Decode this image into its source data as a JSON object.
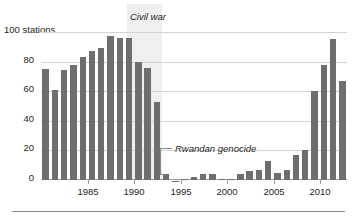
{
  "chart_data": {
    "type": "bar",
    "title": "",
    "subtitle": "",
    "xlabel": "",
    "ylabel": "100 stations",
    "ylim": [
      0,
      100
    ],
    "xlim": [
      1981,
      2013
    ],
    "grid": true,
    "legend_position": "none",
    "yticks": [
      0,
      20,
      40,
      60,
      80,
      100
    ],
    "ytick_labels": [
      "0",
      "20",
      "40",
      "60",
      "80",
      "100 stations"
    ],
    "xticks": [
      1985,
      1990,
      1995,
      2000,
      2005,
      2010
    ],
    "xtick_labels": [
      "1985",
      "1990",
      "1995",
      "2000",
      "2005",
      "2010"
    ],
    "bar_color": "#6e6e6e",
    "shade_color": "#efefef",
    "gridline_color": "#d3d3d3",
    "categories": [
      1981,
      1982,
      1983,
      1984,
      1985,
      1986,
      1987,
      1988,
      1989,
      1990,
      1991,
      1992,
      1993,
      1994,
      1995,
      1996,
      1997,
      1998,
      1999,
      2000,
      2001,
      2002,
      2003,
      2004,
      2005,
      2006,
      2007,
      2008,
      2009,
      2010,
      2011,
      2012,
      2013
    ],
    "values": [
      75,
      61,
      74,
      78,
      83,
      87,
      89,
      97,
      96,
      96,
      80,
      76,
      53,
      4,
      -1,
      1,
      2,
      4,
      4,
      1,
      1,
      4,
      6,
      7,
      13,
      5,
      7,
      17,
      20,
      60,
      78,
      95,
      67
    ],
    "annotations": [
      {
        "text": "Civil war",
        "type": "shaded-span",
        "x_start": 1990,
        "x_end": 1994
      },
      {
        "text": "Rwandan genocide",
        "type": "leader-label",
        "points_to": 1994
      }
    ]
  },
  "labels": {
    "y_axis_top": "100 stations",
    "y_80": "80",
    "y_60": "60",
    "y_40": "40",
    "y_20": "20",
    "y_0": "0",
    "x_1985": "1985",
    "x_1990": "1990",
    "x_1995": "1995",
    "x_2000": "2000",
    "x_2005": "2005",
    "x_2010": "2010",
    "civil_war": "Civil war",
    "rwandan_genocide": "Rwandan genocide"
  }
}
